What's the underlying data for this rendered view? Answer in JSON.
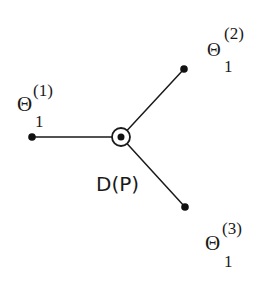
{
  "diagram": {
    "type": "star-graph",
    "center": {
      "label": "D(P)",
      "x": 121,
      "y": 137,
      "marker": "circled-dot"
    },
    "leaves": [
      {
        "symbol": "Θ",
        "superscript": "(1)",
        "subscript": "1",
        "x": 32,
        "y": 137
      },
      {
        "symbol": "Θ",
        "superscript": "(2)",
        "subscript": "1",
        "x": 184,
        "y": 69
      },
      {
        "symbol": "Θ",
        "superscript": "(3)",
        "subscript": "1",
        "x": 185,
        "y": 207
      }
    ],
    "colors": {
      "ink": "#1a1a1a",
      "background": "#ffffff"
    }
  }
}
